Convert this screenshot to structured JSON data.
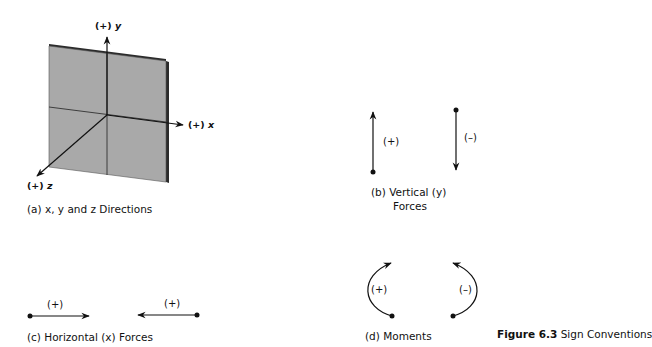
{
  "figure": {
    "number": "Figure 6.3",
    "title": "Sign Conventions"
  },
  "panel_a": {
    "caption": "(a)  x, y and z Directions",
    "axes": {
      "x": {
        "sign": "(+)",
        "name": "x"
      },
      "y": {
        "sign": "(+)",
        "name": "y"
      },
      "z": {
        "sign": "(+)",
        "name": "z"
      }
    },
    "plate_color": "#a9a9a9",
    "plate_edge_color": "#333333"
  },
  "panel_b": {
    "caption_line1": "(b)  Vertical (y)",
    "caption_line2": "Forces",
    "up_label": "(+)",
    "down_label": "(–)"
  },
  "panel_c": {
    "caption": "(c)  Horizontal (x) Forces",
    "right_label": "(+)",
    "left_label": "(+)"
  },
  "panel_d": {
    "caption": "(d)  Moments",
    "ccw_label": "(+)",
    "cw_label": "(–)"
  }
}
